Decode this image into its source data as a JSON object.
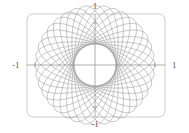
{
  "figure": {
    "name": "parametric-rose-plot",
    "width": 189,
    "height": 133,
    "background_color": "#ffffff"
  },
  "axes": {
    "frame": {
      "name": "plot-frame",
      "stroke_color": "#b4b4b4",
      "corner_radius": 6,
      "x": 27,
      "y": 14,
      "width": 138,
      "height": 103
    },
    "cross": {
      "name": "axis-cross",
      "stroke_color": "#8c8c8c",
      "center_x": 95,
      "center_y": 65
    },
    "labels": {
      "top": "1",
      "bottom": "-1",
      "left": "-1",
      "right": "1"
    }
  },
  "curve": {
    "name": "rose-curve",
    "stroke_color": "#9a9a9a",
    "stroke_width": 0.5,
    "ellipse_count": 18,
    "rotation_step_degrees": 10,
    "semi_major_px": 60,
    "semi_minor_px": 21
  },
  "chart_data": {
    "type": "line",
    "title": "",
    "subtitle": "",
    "xlabel": "",
    "ylabel": "",
    "xlim": [
      -1.35,
      1.35
    ],
    "ylim": [
      -1.25,
      1.25
    ],
    "xticks": [
      -1,
      1
    ],
    "xticklabels": [
      "-1",
      "1"
    ],
    "yticks": [
      -1,
      1
    ],
    "yticklabels": [
      "-1",
      "1"
    ],
    "grid": false,
    "legend": null,
    "legend_position": "none",
    "axis_style": "centered-cross-with-rounded-frame",
    "parametric": {
      "x": "a*cos(t)*cos(k*dtheta) - b*sin(t)*sin(k*dtheta)",
      "y": "a*cos(t)*sin(k*dtheta) + b*sin(t)*cos(k*dtheta)",
      "t_range": [
        0,
        6.283185307179586
      ],
      "k_range": [
        0,
        17
      ],
      "a": 1.0,
      "b": 0.35,
      "dtheta_degrees": 10
    },
    "series": [
      {
        "name": "ellipse-00",
        "rotation_degrees": 0
      },
      {
        "name": "ellipse-01",
        "rotation_degrees": 10
      },
      {
        "name": "ellipse-02",
        "rotation_degrees": 20
      },
      {
        "name": "ellipse-03",
        "rotation_degrees": 30
      },
      {
        "name": "ellipse-04",
        "rotation_degrees": 40
      },
      {
        "name": "ellipse-05",
        "rotation_degrees": 50
      },
      {
        "name": "ellipse-06",
        "rotation_degrees": 60
      },
      {
        "name": "ellipse-07",
        "rotation_degrees": 70
      },
      {
        "name": "ellipse-08",
        "rotation_degrees": 80
      },
      {
        "name": "ellipse-09",
        "rotation_degrees": 90
      },
      {
        "name": "ellipse-10",
        "rotation_degrees": 100
      },
      {
        "name": "ellipse-11",
        "rotation_degrees": 110
      },
      {
        "name": "ellipse-12",
        "rotation_degrees": 120
      },
      {
        "name": "ellipse-13",
        "rotation_degrees": 130
      },
      {
        "name": "ellipse-14",
        "rotation_degrees": 140
      },
      {
        "name": "ellipse-15",
        "rotation_degrees": 150
      },
      {
        "name": "ellipse-16",
        "rotation_degrees": 160
      },
      {
        "name": "ellipse-17",
        "rotation_degrees": 170
      }
    ]
  }
}
